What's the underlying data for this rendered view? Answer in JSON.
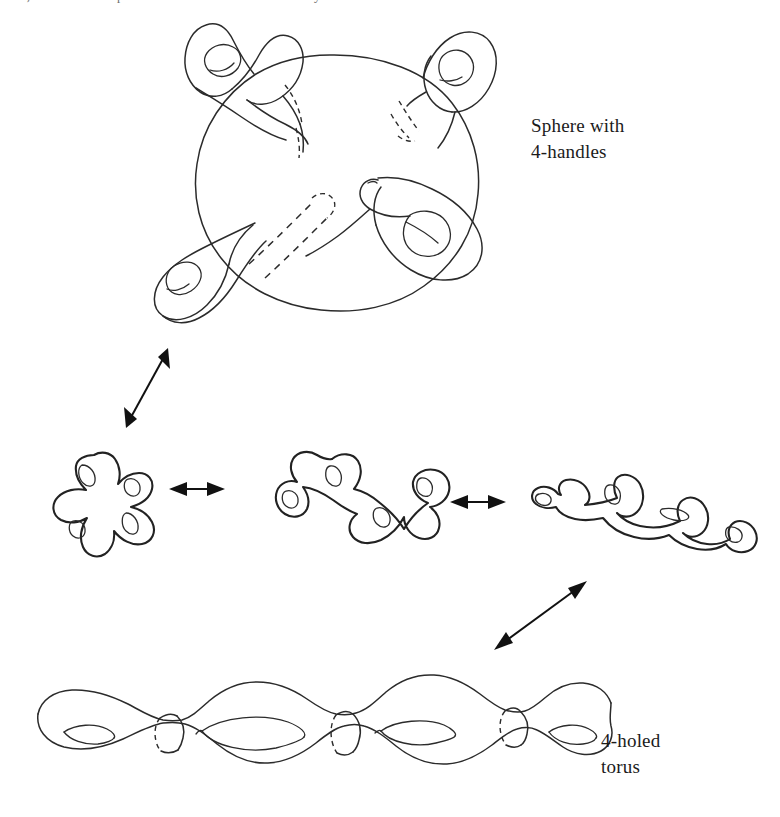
{
  "page": {
    "background_color": "#ffffff",
    "ink_color": "#2b2b2b",
    "width": 780,
    "height": 817,
    "header_text_partial": "and, since it is a compact oriented surface without boundary"
  },
  "labels": {
    "sphere_with_handles": "Sphere with\n4-handles",
    "four_holed_torus": "4-holed\ntorus"
  },
  "figures": [
    {
      "id": "sphere-with-4-handles",
      "name": "Sphere with 4-handles",
      "description": "A large sphere drawn as a circle with four tubular handles attached, each handle ending in a lobe containing a lens-shaped hole. Dashed curves indicate the parts of the handles hidden behind the sphere.",
      "handle_count": 4,
      "hole_count": 4,
      "genus": 4,
      "hidden_line_style": "dashed"
    },
    {
      "id": "cross-4-lobes",
      "name": "Four-lobed cross form",
      "description": "A flattened X-shaped surface with four lobes radiating from a centre, each lobe containing a lens-shaped hole.",
      "hole_count": 4,
      "genus": 4
    },
    {
      "id": "zigzag-4-lobes",
      "name": "Intermediate zig-zag form",
      "description": "A stretched H/zig-zag shaped surface with four lobes, each containing a lens-shaped hole.",
      "hole_count": 4,
      "genus": 4
    },
    {
      "id": "linear-4-lobes",
      "name": "Near-linear chain form",
      "description": "An almost straight chain of four lobes, each containing a lens-shaped hole.",
      "hole_count": 4,
      "genus": 4
    },
    {
      "id": "four-holed-torus",
      "name": "4-holed torus",
      "description": "A genus-4 surface drawn as four bulges joined by narrow necks, each bulge containing a lens-shaped hole; dashed arcs mark the separating circles at the necks.",
      "hole_count": 4,
      "genus": 4,
      "neck_count": 3,
      "hidden_line_style": "dashed"
    }
  ],
  "arrows": [
    {
      "id": "arrow-sphere-to-cross",
      "name": "equivalence arrow sphere to cross",
      "kind": "double-headed",
      "orientation": "diagonal-up-right",
      "meaning": "homeomorphic to"
    },
    {
      "id": "arrow-cross-to-zigzag",
      "name": "equivalence arrow cross to zigzag",
      "kind": "double-headed",
      "orientation": "horizontal",
      "meaning": "homeomorphic to"
    },
    {
      "id": "arrow-zigzag-to-linear",
      "name": "equivalence arrow zigzag to linear",
      "kind": "double-headed",
      "orientation": "horizontal",
      "meaning": "homeomorphic to"
    },
    {
      "id": "arrow-linear-to-torus",
      "name": "equivalence arrow linear to torus",
      "kind": "double-headed",
      "orientation": "diagonal-up-right",
      "meaning": "homeomorphic to"
    }
  ]
}
